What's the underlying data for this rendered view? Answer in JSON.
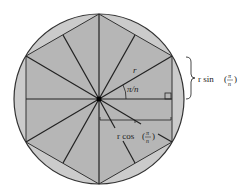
{
  "diagram": {
    "labels": {
      "radius": "r",
      "angle": "π/n",
      "opposite": "r sin",
      "adjacent": "r cos",
      "frac_num": "π",
      "frac_den": "n"
    },
    "colors": {
      "circle_fill": "#c8c8c8",
      "polygon_fill": "#b4b4b4",
      "stroke": "#222222"
    }
  }
}
